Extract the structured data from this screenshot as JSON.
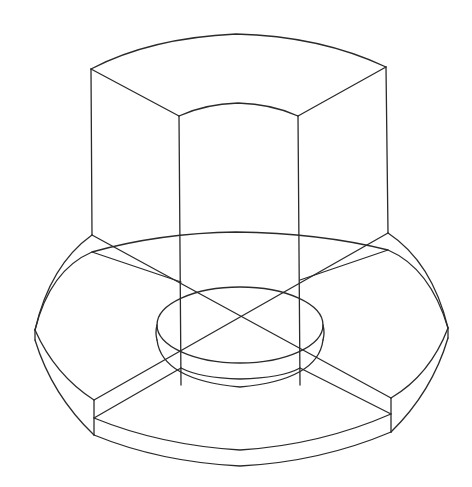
{
  "drawing": {
    "title": "Isometric wireframe: cylindrical column segment on flanged washer",
    "stroke_color": "#2b2b2b",
    "background_color": "#ffffff",
    "parts": [
      {
        "name": "column-top-face",
        "label": "Column top face (curved quarter segment)"
      },
      {
        "name": "column-walls",
        "label": "Column vertical edges"
      },
      {
        "name": "flange-top-rim",
        "label": "Flange top rim"
      },
      {
        "name": "flange-bottom-rim",
        "label": "Flange bottom rim"
      },
      {
        "name": "center-hole",
        "label": "Center bore"
      },
      {
        "name": "quadrant-dividers",
        "label": "Quadrant dividing lines"
      }
    ]
  }
}
